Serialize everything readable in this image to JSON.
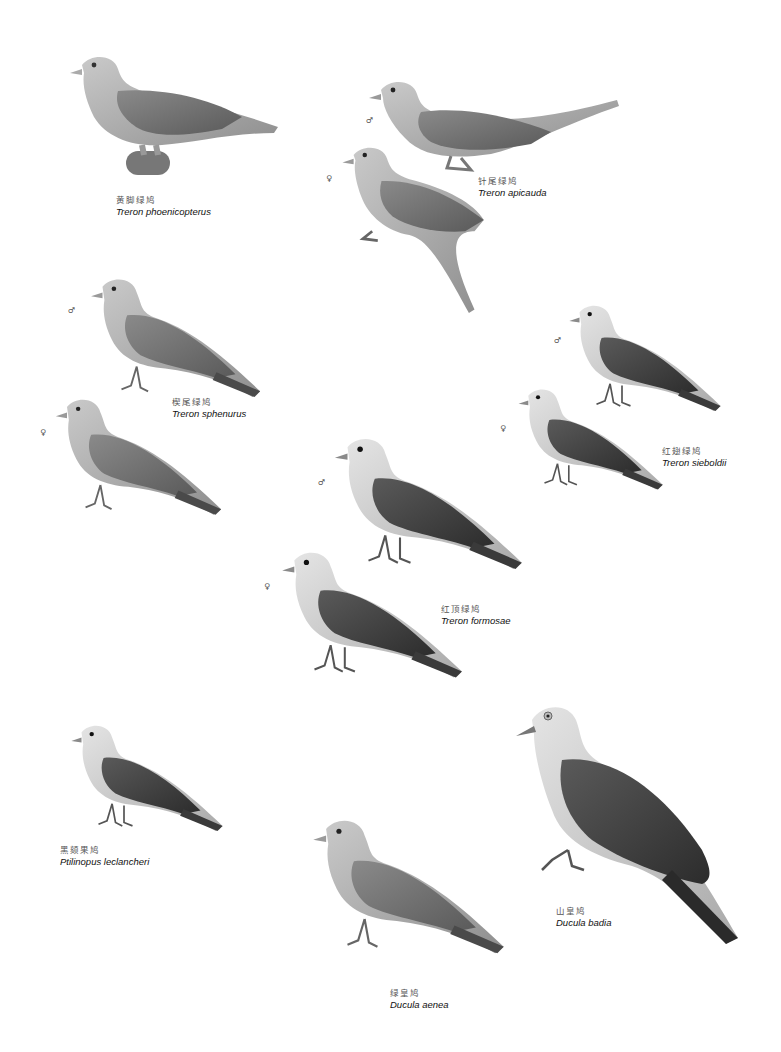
{
  "plate": {
    "species": [
      {
        "id": "treron-phoenicopterus",
        "chinese_name": "黄脚绿鸠",
        "scientific_name": "Treron phoenicopterus",
        "figures": [
          {
            "sex": ""
          }
        ]
      },
      {
        "id": "treron-apicauda",
        "chinese_name": "针尾绿鸠",
        "scientific_name": "Treron apicauda",
        "figures": [
          {
            "sex": "♂"
          },
          {
            "sex": "♀"
          }
        ]
      },
      {
        "id": "treron-sphenurus",
        "chinese_name": "楔尾绿鸠",
        "scientific_name": "Treron sphenurus",
        "figures": [
          {
            "sex": "♂"
          },
          {
            "sex": "♀"
          }
        ]
      },
      {
        "id": "treron-sieboldii",
        "chinese_name": "红翅绿鸠",
        "scientific_name": "Treron sieboldii",
        "figures": [
          {
            "sex": "♂"
          },
          {
            "sex": "♀"
          }
        ]
      },
      {
        "id": "treron-formosae",
        "chinese_name": "红顶绿鸠",
        "scientific_name": "Treron formosae",
        "figures": [
          {
            "sex": "♂"
          },
          {
            "sex": "♀"
          }
        ]
      },
      {
        "id": "ptilinopus-leclancheri",
        "chinese_name": "黑颏果鸠",
        "scientific_name": "Ptilinopus leclancheri",
        "figures": [
          {
            "sex": ""
          }
        ]
      },
      {
        "id": "ducula-badia",
        "chinese_name": "山皇鸠",
        "scientific_name": "Ducula badia",
        "figures": [
          {
            "sex": ""
          }
        ]
      },
      {
        "id": "ducula-aenea",
        "chinese_name": "绿皇鸠",
        "scientific_name": "Ducula aenea",
        "figures": [
          {
            "sex": ""
          }
        ]
      }
    ]
  }
}
